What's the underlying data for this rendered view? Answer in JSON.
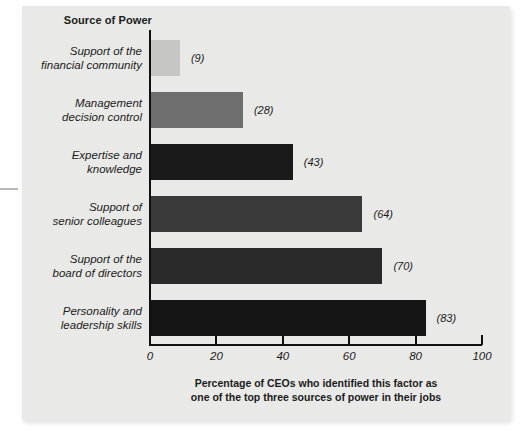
{
  "figure": {
    "title": "Source of Power",
    "caption_line1": "Percentage of CEOs who identified this factor as",
    "caption_line2": "one of the top three sources of power in their jobs"
  },
  "chart_data": {
    "type": "bar",
    "orientation": "horizontal",
    "title": "Source of Power",
    "xlabel": "Percentage of CEOs who identified this factor as one of the top three sources of power in their jobs",
    "ylabel": "Source of Power",
    "xlim": [
      0,
      100
    ],
    "xticks": [
      0,
      20,
      40,
      60,
      80,
      100
    ],
    "xticklabels": [
      "0",
      "20",
      "40",
      "60",
      "80",
      "100"
    ],
    "grid": false,
    "legend": false,
    "categories": [
      "Support of the\nfinancial community",
      "Management\ndecision control",
      "Expertise and\nknowledge",
      "Support of\nsenior colleagues",
      "Support of the\nboard of directors",
      "Personality and\nleadership skills"
    ],
    "values": [
      9,
      28,
      43,
      64,
      70,
      83
    ],
    "value_labels": [
      "(9)",
      "(28)",
      "(43)",
      "(64)",
      "(70)",
      "(83)"
    ],
    "bar_colors": [
      "#c6c6c4",
      "#6e6e6e",
      "#1a1a1a",
      "#3a3a3a",
      "#2a2a2a",
      "#141414"
    ],
    "bars": [
      {
        "label_line1": "Support of the",
        "label_line2": "financial community",
        "value": 9,
        "value_label": "(9)",
        "color": "#c6c6c4"
      },
      {
        "label_line1": "Management",
        "label_line2": "decision control",
        "value": 28,
        "value_label": "(28)",
        "color": "#6e6e6e"
      },
      {
        "label_line1": "Expertise and",
        "label_line2": "knowledge",
        "value": 43,
        "value_label": "(43)",
        "color": "#1a1a1a"
      },
      {
        "label_line1": "Support of",
        "label_line2": "senior colleagues",
        "value": 64,
        "value_label": "(64)",
        "color": "#3a3a3a"
      },
      {
        "label_line1": "Support of the",
        "label_line2": "board of directors",
        "value": 70,
        "value_label": "(70)",
        "color": "#2a2a2a"
      },
      {
        "label_line1": "Personality and",
        "label_line2": "leadership skills",
        "value": 83,
        "value_label": "(83)",
        "color": "#141414"
      }
    ]
  },
  "style": {
    "panel_bg": "#e9e9e7",
    "axis_color": "#101010",
    "text_color": "#1b1b1b"
  }
}
